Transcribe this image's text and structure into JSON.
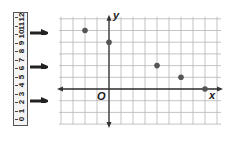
{
  "ruler": {
    "labels": [
      "0",
      "1",
      "2",
      "3",
      "4",
      "5",
      "6",
      "7",
      "8",
      "9",
      "10",
      "11",
      "12"
    ],
    "arrows_at": [
      2,
      6,
      10
    ]
  },
  "graph": {
    "x_axis_label": "x",
    "y_axis_label": "y",
    "origin_label": "O",
    "grid": {
      "x_min": -4,
      "x_max": 9,
      "y_min": -3,
      "y_max": 6
    },
    "points": [
      {
        "x": -2,
        "y": 5
      },
      {
        "x": 0,
        "y": 4
      },
      {
        "x": 4,
        "y": 2
      },
      {
        "x": 6,
        "y": 1
      },
      {
        "x": 8,
        "y": 0
      }
    ],
    "colors": {
      "grid": "#b5b5b5",
      "axis": "#333333",
      "point": "#555555"
    }
  }
}
